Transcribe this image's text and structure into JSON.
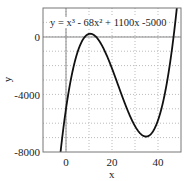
{
  "chart_data": {
    "type": "line",
    "title": "",
    "annotation": "y = x³ - 68x² + 1100x -5000",
    "xlabel": "x",
    "ylabel": "y",
    "xlim": [
      -10,
      50
    ],
    "ylim": [
      -8000,
      2000
    ],
    "xticks": [
      0,
      20,
      40
    ],
    "yticks": [
      0,
      -4000,
      -8000
    ],
    "grid": true,
    "series": [
      {
        "name": "y = x^3 - 68x^2 + 1100x - 5000",
        "coefficients": [
          1,
          -68,
          1100,
          -5000
        ]
      }
    ]
  },
  "labels": {
    "annotation": "y = x³ - 68x² + 1100x -5000",
    "xlabel": "x",
    "ylabel": "y",
    "yticks": [
      "0",
      "-4000",
      "-8000"
    ],
    "xticks": [
      "0",
      "20",
      "40"
    ]
  }
}
